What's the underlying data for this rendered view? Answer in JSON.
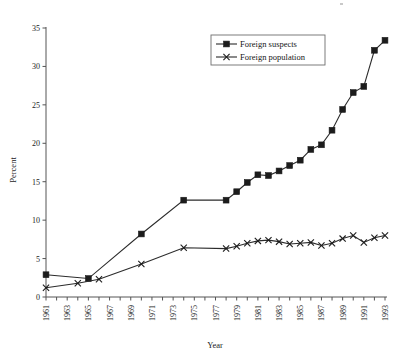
{
  "chart_data": {
    "type": "line",
    "title": "",
    "xlabel": "Year",
    "ylabel": "Percent",
    "xlim": [
      1961,
      1993
    ],
    "ylim": [
      0,
      35
    ],
    "yticks": [
      0,
      5,
      10,
      15,
      20,
      25,
      30,
      35
    ],
    "xticks_major": [
      1961,
      1963,
      1965,
      1967,
      1969,
      1971,
      1973,
      1975,
      1977,
      1979,
      1981,
      1983,
      1985,
      1987,
      1989,
      1991,
      1993
    ],
    "xticks_minor_every": 1,
    "grid": false,
    "legend_position": "top-center-right",
    "series": [
      {
        "name": "Foreign suspects",
        "marker": "square",
        "x": [
          1961,
          1965,
          1970,
          1974,
          1978,
          1979,
          1980,
          1981,
          1982,
          1983,
          1984,
          1985,
          1986,
          1987,
          1988,
          1989,
          1990,
          1991,
          1992,
          1993
        ],
        "values": [
          2.9,
          2.4,
          8.2,
          12.6,
          12.6,
          13.7,
          14.9,
          15.9,
          15.8,
          16.4,
          17.1,
          17.8,
          19.2,
          19.8,
          21.7,
          24.4,
          26.6,
          27.4,
          32.1,
          33.4
        ]
      },
      {
        "name": "Foreign population",
        "marker": "x",
        "x": [
          1961,
          1964,
          1966,
          1970,
          1974,
          1978,
          1979,
          1980,
          1981,
          1982,
          1983,
          1984,
          1985,
          1986,
          1987,
          1988,
          1989,
          1990,
          1991,
          1992,
          1993
        ],
        "values": [
          1.2,
          1.8,
          2.3,
          4.3,
          6.4,
          6.3,
          6.6,
          7.0,
          7.3,
          7.4,
          7.2,
          6.9,
          7.0,
          7.1,
          6.7,
          7.0,
          7.6,
          8.0,
          7.1,
          7.7,
          8.0
        ]
      }
    ]
  },
  "legend": {
    "entries": [
      {
        "label": "Foreign suspects"
      },
      {
        "label": "Foreign population"
      }
    ]
  },
  "axes": {
    "y_title": "Percent",
    "x_title": "Year",
    "y_tick_labels": [
      "0",
      "5",
      "10",
      "15",
      "20",
      "25",
      "30",
      "35"
    ],
    "x_tick_labels": [
      "1961",
      "1963",
      "1965",
      "1967",
      "1969",
      "1971",
      "1973",
      "1975",
      "1977",
      "1979",
      "1981",
      "1983",
      "1985",
      "1987",
      "1989",
      "1991",
      "1993"
    ]
  },
  "colors": {
    "line": "#2b2b2b",
    "axis": "#545454",
    "text": "#1a1a1a",
    "background": "#ffffff"
  }
}
